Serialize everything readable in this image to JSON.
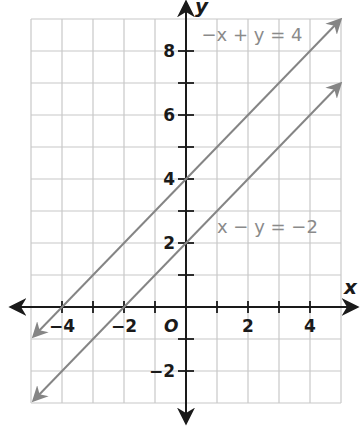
{
  "chart_data": {
    "type": "line",
    "title": "",
    "xlabel": "x",
    "ylabel": "y",
    "origin_label": "O",
    "xlim": [
      -5,
      5
    ],
    "ylim": [
      -3,
      9
    ],
    "grid": true,
    "grid_step": 1,
    "x_ticks": [
      -4,
      -3,
      -2,
      -1,
      1,
      2,
      3,
      4
    ],
    "y_ticks": [
      -2,
      -1,
      1,
      2,
      3,
      4,
      5,
      6,
      7,
      8
    ],
    "x_tick_labels": [
      {
        "value": -4,
        "text": "−4"
      },
      {
        "value": -2,
        "text": "−2"
      },
      {
        "value": 2,
        "text": "2"
      },
      {
        "value": 4,
        "text": "4"
      }
    ],
    "y_tick_labels": [
      {
        "value": 8,
        "text": "8"
      },
      {
        "value": 6,
        "text": "6"
      },
      {
        "value": 4,
        "text": "4"
      },
      {
        "value": 2,
        "text": "2"
      },
      {
        "value": -2,
        "text": "−2"
      }
    ],
    "series": [
      {
        "name": "−x + y = 4",
        "equation": "y = x + 4",
        "slope": 1,
        "intercept": 4,
        "x": [
          -5,
          5
        ],
        "y": [
          -1,
          9
        ],
        "color": "#858585",
        "label_anchor": {
          "x": 0.5,
          "y": 8.5
        }
      },
      {
        "name": "x − y = −2",
        "equation": "y = x + 2",
        "slope": 1,
        "intercept": 2,
        "x": [
          -5,
          5
        ],
        "y": [
          -3,
          7
        ],
        "color": "#858585",
        "label_anchor": {
          "x": 1.0,
          "y": 2.5
        }
      }
    ],
    "colors": {
      "axis": "#1a1a1a",
      "grid": "#c8c8c8",
      "line": "#858585"
    }
  }
}
